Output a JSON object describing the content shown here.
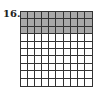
{
  "problem": {
    "number": "16.",
    "grid": {
      "rows": 10,
      "cols": 10,
      "shaded_rows": 3,
      "shaded_cells": 30,
      "total_cells": 100,
      "shade_color": "#a8a8a8",
      "line_color": "#333333"
    }
  }
}
